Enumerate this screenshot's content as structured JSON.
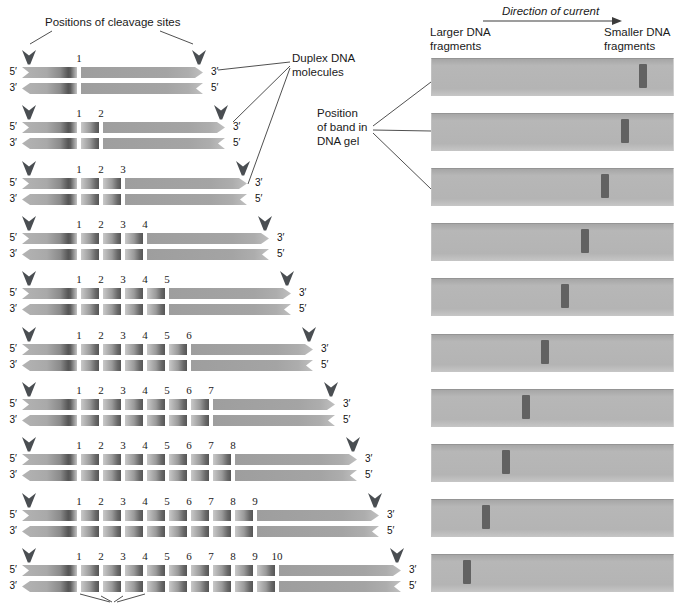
{
  "figure": {
    "labels": {
      "cleavage_sites": "Positions of cleavage sites",
      "duplex_dna": [
        "Duplex DNA",
        "molecules"
      ],
      "band_position": [
        "Position",
        "of band in",
        "DNA gel"
      ],
      "direction_of_current": "Direction of current",
      "larger_fragments": [
        "Larger DNA",
        "fragments"
      ],
      "smaller_fragments": [
        "Smaller DNA",
        "fragments"
      ]
    },
    "strand_ends": {
      "left_top": "5′",
      "left_bottom": "3′",
      "right_top": "3′",
      "right_bottom": "5′"
    },
    "rows": [
      {
        "cleavage_site_labels": [
          "1"
        ]
      },
      {
        "cleavage_site_labels": [
          "1",
          "2"
        ]
      },
      {
        "cleavage_site_labels": [
          "1",
          "2",
          "3"
        ]
      },
      {
        "cleavage_site_labels": [
          "1",
          "2",
          "3",
          "4"
        ]
      },
      {
        "cleavage_site_labels": [
          "1",
          "2",
          "3",
          "4",
          "5"
        ]
      },
      {
        "cleavage_site_labels": [
          "1",
          "2",
          "3",
          "4",
          "5",
          "6"
        ]
      },
      {
        "cleavage_site_labels": [
          "1",
          "2",
          "3",
          "4",
          "5",
          "6",
          "7"
        ]
      },
      {
        "cleavage_site_labels": [
          "1",
          "2",
          "3",
          "4",
          "5",
          "6",
          "7",
          "8"
        ]
      },
      {
        "cleavage_site_labels": [
          "1",
          "2",
          "3",
          "4",
          "5",
          "6",
          "7",
          "8",
          "9"
        ]
      },
      {
        "cleavage_site_labels": [
          "1",
          "2",
          "3",
          "4",
          "5",
          "6",
          "7",
          "8",
          "9",
          "10"
        ]
      }
    ],
    "gel": {
      "lanes": 10,
      "band_x": [
        639,
        621,
        601,
        581,
        561,
        541,
        522,
        502,
        482,
        463
      ]
    },
    "colors": {
      "strand_gray": "#a6a6a6",
      "strand_dark": "#565656",
      "strand_light": "#c9c9c9",
      "arrowhead": "#4a4e52",
      "lane_bg": "#b4b4b4",
      "band": "#626262",
      "line": "#3c3c3c",
      "text": "#1a1a1a"
    },
    "connectors": [
      [
        52,
        31,
        30,
        44
      ],
      [
        160,
        31,
        193,
        44
      ],
      [
        290,
        62,
        218,
        70
      ],
      [
        290,
        66,
        233,
        122
      ],
      [
        290,
        68,
        248,
        184
      ],
      [
        373,
        126,
        431,
        82
      ],
      [
        373,
        130,
        431,
        131
      ],
      [
        373,
        133,
        431,
        189
      ],
      [
        80,
        594,
        110,
        602
      ],
      [
        101,
        596,
        112,
        602
      ],
      [
        123,
        596,
        114,
        602
      ],
      [
        145,
        594,
        117,
        602
      ]
    ],
    "direction_arrow": {
      "x1": 483,
      "y": 21,
      "x2": 622
    }
  }
}
